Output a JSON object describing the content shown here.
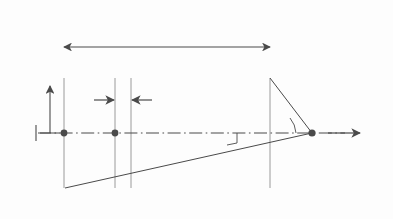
{
  "figure": {
    "type": "physics-diagram",
    "width": 393,
    "height": 219,
    "background_color": "#fdfdfd",
    "ink_color": "#4a4a4a"
  },
  "labels": {
    "length": "l",
    "radius": "a",
    "origin": "O",
    "current": "I",
    "z_position": "z",
    "element": "dz",
    "theta2_base": "θ",
    "theta2_sub": "2",
    "theta1_base": "θ",
    "theta1_sub": "1",
    "point_prefix": "P(",
    "point_base": "z",
    "point_sub": "0",
    "point_suffix": ")",
    "z_axis": "z"
  },
  "geometry": {
    "solenoid_left_x": 64,
    "solenoid_right_x": 270,
    "top_coil_y": 78,
    "bottom_coil_y": 188,
    "axis_y": 133,
    "field_point_x": 312,
    "dz_left_x": 115,
    "dz_right_x": 131,
    "turn_count": 19,
    "length_arrow_y": 47,
    "axis_arrow_tip_x": 360
  },
  "icons": {
    "current_out_of_page": "circle-dot-icon",
    "current_into_page": "circle-cross-icon",
    "axis_arrow": "arrow-right-icon",
    "radius_arrow": "arrow-up-icon",
    "length_arrow": "double-arrow-icon",
    "right_angle": "right-angle-marker-icon"
  }
}
